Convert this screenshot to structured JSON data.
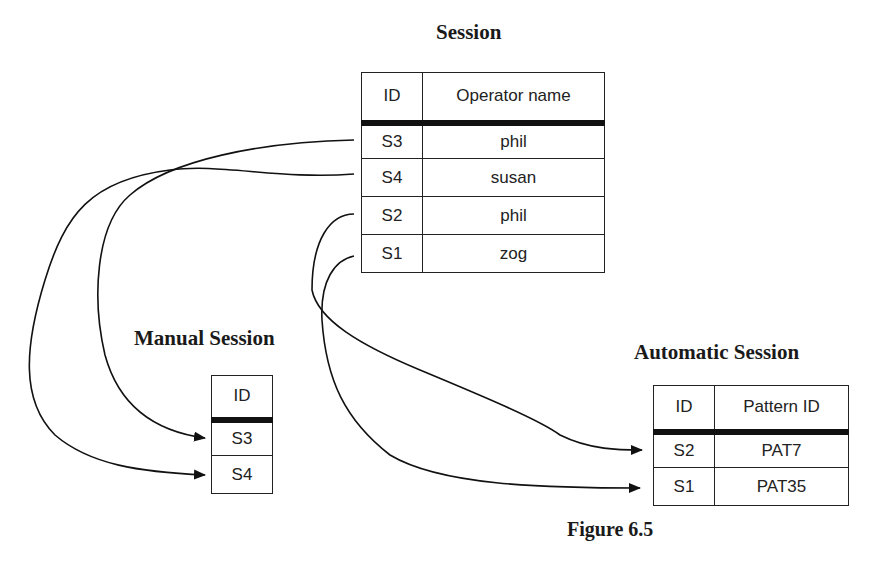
{
  "session": {
    "title": "Session",
    "columns": [
      "ID",
      "Operator name"
    ],
    "rows": [
      {
        "id": "S3",
        "operator_name": "phil"
      },
      {
        "id": "S4",
        "operator_name": "susan"
      },
      {
        "id": "S2",
        "operator_name": "phil"
      },
      {
        "id": "S1",
        "operator_name": "zog"
      }
    ]
  },
  "manual_session": {
    "title": "Manual Session",
    "columns": [
      "ID"
    ],
    "rows": [
      {
        "id": "S3"
      },
      {
        "id": "S4"
      }
    ]
  },
  "automatic_session": {
    "title": "Automatic Session",
    "columns": [
      "ID",
      "Pattern ID"
    ],
    "rows": [
      {
        "id": "S2",
        "pattern_id": "PAT7"
      },
      {
        "id": "S1",
        "pattern_id": "PAT35"
      }
    ]
  },
  "links": [
    {
      "from": "Session.S3",
      "to": "Manual Session.S3"
    },
    {
      "from": "Session.S4",
      "to": "Manual Session.S4"
    },
    {
      "from": "Session.S2",
      "to": "Automatic Session.S2"
    },
    {
      "from": "Session.S1",
      "to": "Automatic Session.S1"
    }
  ],
  "caption": "Figure 6.5"
}
